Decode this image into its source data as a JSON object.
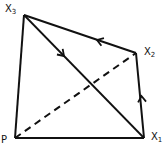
{
  "diagram": {
    "background": "#ffffff",
    "stroke_color": "#111111",
    "vertices": {
      "P": {
        "x": 15,
        "y": 138,
        "label": "P",
        "sub": ""
      },
      "X1": {
        "x": 144,
        "y": 138,
        "label": "X",
        "sub": "1"
      },
      "X2": {
        "x": 136,
        "y": 53,
        "label": "X",
        "sub": "2"
      },
      "X3": {
        "x": 24,
        "y": 15,
        "label": "X",
        "sub": "3"
      }
    },
    "edges": [
      {
        "from": "P",
        "to": "X1",
        "style": "solid"
      },
      {
        "from": "P",
        "to": "X3",
        "style": "solid"
      },
      {
        "from": "X3",
        "to": "X1",
        "style": "solid",
        "arrow": "toward X1"
      },
      {
        "from": "X1",
        "to": "X2",
        "style": "solid",
        "arrow": "toward X2"
      },
      {
        "from": "X2",
        "to": "X3",
        "style": "solid",
        "arrow": "toward X3"
      },
      {
        "from": "P",
        "to": "X2",
        "style": "dashed"
      }
    ]
  }
}
